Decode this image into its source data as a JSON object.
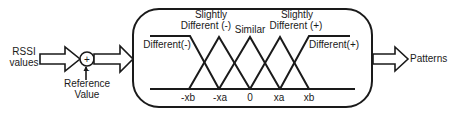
{
  "diagram": {
    "input": {
      "line1": "RSSI",
      "line2": "values"
    },
    "summing_junction": {
      "plus_sign": "+",
      "minus_sign": "-"
    },
    "reference": {
      "line1": "Reference",
      "line2": "Value"
    },
    "membership": {
      "labels": {
        "different_neg": "Different(-)",
        "slightly_neg_line1": "Slightly",
        "slightly_neg_line2": "Different (-)",
        "similar": "Similar",
        "slightly_pos_line1": "Slightly",
        "slightly_pos_line2": "Different (+)",
        "different_pos": "Different(+)"
      },
      "axis_ticks": [
        "-xb",
        "-xa",
        "0",
        "xa",
        "xb"
      ]
    },
    "output": {
      "label": "Patterns"
    },
    "colors": {
      "stroke": "#1a1a1a",
      "background": "#ffffff"
    }
  }
}
